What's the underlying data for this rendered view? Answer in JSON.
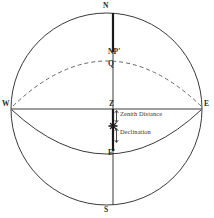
{
  "figure": {
    "width": 214,
    "height": 218,
    "background": "#ffffff",
    "line_color": "#3a3a3a",
    "thick_line_color": "#1a1a1a",
    "dashed_line_color": "#555555",
    "text_color": "#2b2b2b"
  },
  "labels": {
    "north": "N",
    "north_pole": "NP'",
    "equator_point": "Q",
    "west": "W",
    "east": "E",
    "zenith": "Z",
    "equator_prime": "E'",
    "south": "S"
  },
  "annotations": {
    "zenith_distance": "Zenith Distance",
    "declination": "Declination"
  },
  "geometry": {
    "circle": {
      "cx": 106.5,
      "cy": 109,
      "rx": 95.5,
      "ry": 96
    },
    "meridian": {
      "x": 113,
      "y_top": 13,
      "y_bottom": 205
    },
    "horizon": {
      "y": 109,
      "x_left": 11,
      "x_right": 202
    },
    "celestial_equator": {
      "type": "dashed-arc",
      "from": "W",
      "via": "Q",
      "to": "E",
      "apex_y": 62
    },
    "lower_arc": {
      "type": "solid-arc",
      "from": "W",
      "via": "E'",
      "to": "E",
      "apex_y": 152
    },
    "thick_segment_north": {
      "x": 113,
      "y_from": 13,
      "y_to": 52
    },
    "thick_segment_zenith": {
      "x": 113,
      "y_from": 109,
      "y_to": 151
    },
    "star_marker": {
      "x": 113,
      "y": 126
    },
    "indicator_zenith_distance": {
      "x": 116,
      "y_from": 111,
      "y_to": 122
    },
    "indicator_declination": {
      "x": 116,
      "y_from": 129,
      "y_to": 142
    }
  }
}
